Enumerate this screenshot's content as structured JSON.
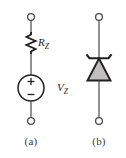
{
  "figure": {
    "background_color": "#ffffff",
    "line_color": "#231f20",
    "fill_color": "#bfbfbf",
    "width": 126,
    "height": 158
  },
  "panels": [
    {
      "id": "a",
      "caption": "(a)",
      "description": "Zener equivalent circuit: series resistance and voltage source",
      "components": [
        {
          "name": "zener-resistance",
          "symbol": "resistor",
          "label_text": "R",
          "label_subscript": "Z"
        },
        {
          "name": "zener-voltage-source",
          "symbol": "voltage-source",
          "label_text": "V",
          "label_subscript": "Z",
          "polarity_top": "+",
          "polarity_bottom": "−"
        }
      ],
      "terminals": [
        "top-terminal",
        "bottom-terminal"
      ]
    },
    {
      "id": "b",
      "caption": "(b)",
      "description": "Zener diode schematic symbol",
      "components": [
        {
          "name": "zener-diode",
          "symbol": "zener-diode"
        }
      ],
      "terminals": [
        "top-terminal",
        "bottom-terminal"
      ]
    }
  ],
  "labels": {
    "rz_main": "R",
    "rz_sub": "Z",
    "vz_main": "V",
    "vz_sub": "Z",
    "plus_sign": "+",
    "minus_sign": "−",
    "caption_a": "(a)",
    "caption_b": "(b)"
  }
}
